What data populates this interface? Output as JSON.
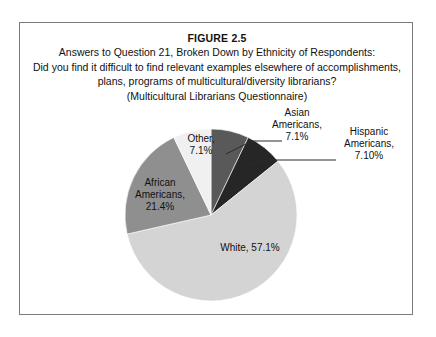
{
  "figure": {
    "number": "FIGURE 2.5",
    "caption_lines": [
      "Answers to Question 21, Broken Down by Ethnicity of Respondents:",
      "Did you find it difficult to find relevant examples elsewhere of accomplishments,",
      "plans, programs of multicultural/diversity librarians?",
      "(Multicultural Librarians Questionnaire)"
    ]
  },
  "chart_data": {
    "type": "pie",
    "title": "Answers to Question 21, Broken Down by Ethnicity of Respondents",
    "subtitle": "(Multicultural Librarians Questionnaire)",
    "legend_position": "none",
    "start_angle_deg": 0,
    "direction": "clockwise",
    "categories": [
      "Asian Americans",
      "Hispanic Americans",
      "White",
      "African Americans",
      "Other"
    ],
    "values": [
      7.1,
      7.1,
      57.1,
      21.4,
      7.1
    ],
    "value_unit": "%",
    "slices": [
      {
        "name": "Asian Americans",
        "value": 7.1,
        "label_line1": "Asian",
        "label_line2": "Americans,",
        "label_line3": "7.1%",
        "color": "#595959",
        "label_placement": "outside",
        "has_leader_line": true
      },
      {
        "name": "Hispanic Americans",
        "value": 7.1,
        "label_line1": "Hispanic",
        "label_line2": "Americans,",
        "label_line3": "7.10%",
        "color": "#262626",
        "label_placement": "outside",
        "has_leader_line": true
      },
      {
        "name": "White",
        "value": 57.1,
        "label_line1": "White, 57.1%",
        "color": "#d4d4d4",
        "label_placement": "inside",
        "has_leader_line": false
      },
      {
        "name": "African Americans",
        "value": 21.4,
        "label_line1": "African",
        "label_line2": "Americans,",
        "label_line3": "21.4%",
        "color": "#8f8f8f",
        "label_placement": "inside",
        "has_leader_line": false
      },
      {
        "name": "Other",
        "value": 7.1,
        "label_line1": "Other,",
        "label_line2": "7.1%",
        "color": "#f0f0f0",
        "label_placement": "inside",
        "has_leader_line": false
      }
    ],
    "colors": {
      "asian": "#595959",
      "hispanic": "#262626",
      "white": "#d4d4d4",
      "african": "#8f8f8f",
      "other": "#f0f0f0",
      "frame_border": "#7a7a7a",
      "text": "#111111"
    }
  }
}
